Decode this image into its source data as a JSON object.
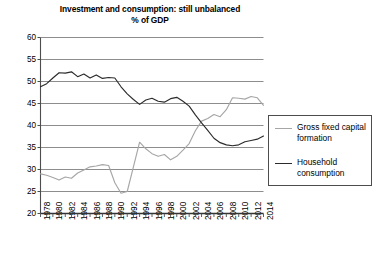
{
  "chart_data": {
    "type": "line",
    "title": "Investment and consumption: still unbalanced",
    "subtitle": "% of GDP",
    "xlabel": "",
    "ylabel": "",
    "ylim": [
      20,
      60
    ],
    "yticks": [
      20,
      25,
      30,
      35,
      40,
      45,
      50,
      55,
      60
    ],
    "grid": true,
    "legend_position": "right",
    "xlim": [
      1978,
      2014
    ],
    "xticks": [
      1978,
      1980,
      1982,
      1984,
      1986,
      1988,
      1990,
      1992,
      1994,
      1996,
      1998,
      2000,
      2002,
      2004,
      2006,
      2008,
      2010,
      2012,
      2014
    ],
    "x": [
      1978,
      1979,
      1980,
      1981,
      1982,
      1983,
      1984,
      1985,
      1986,
      1987,
      1988,
      1989,
      1990,
      1991,
      1992,
      1993,
      1994,
      1995,
      1996,
      1997,
      1998,
      1999,
      2000,
      2001,
      2002,
      2003,
      2004,
      2005,
      2006,
      2007,
      2008,
      2009,
      2010,
      2011,
      2012,
      2013,
      2014
    ],
    "series": [
      {
        "name": "Gross fixed capital formation",
        "color": "#a6a6a6",
        "values": [
          29.0,
          28.7,
          28.2,
          27.6,
          28.3,
          28.0,
          29.2,
          29.9,
          30.6,
          30.8,
          31.1,
          30.9,
          27.0,
          24.6,
          25.0,
          30.6,
          36.2,
          34.7,
          33.6,
          33.0,
          33.4,
          32.2,
          33.0,
          34.4,
          35.9,
          38.8,
          41.0,
          41.6,
          42.5,
          42.0,
          43.6,
          46.3,
          46.2,
          46.0,
          46.6,
          46.3,
          44.6
        ]
      },
      {
        "name": "Household consumption",
        "color": "#2b2b2b",
        "values": [
          48.8,
          49.5,
          50.8,
          52.0,
          51.9,
          52.2,
          51.1,
          51.7,
          50.8,
          51.5,
          50.7,
          50.9,
          50.8,
          48.8,
          47.2,
          45.9,
          44.8,
          45.8,
          46.2,
          45.5,
          45.3,
          46.1,
          46.4,
          45.5,
          44.4,
          42.4,
          40.6,
          38.9,
          37.1,
          36.1,
          35.6,
          35.4,
          35.6,
          36.3,
          36.6,
          36.9,
          37.6
        ]
      }
    ]
  },
  "legend": {
    "entries": [
      {
        "label": "Gross fixed capital formation"
      },
      {
        "label": "Household consumption"
      }
    ]
  }
}
